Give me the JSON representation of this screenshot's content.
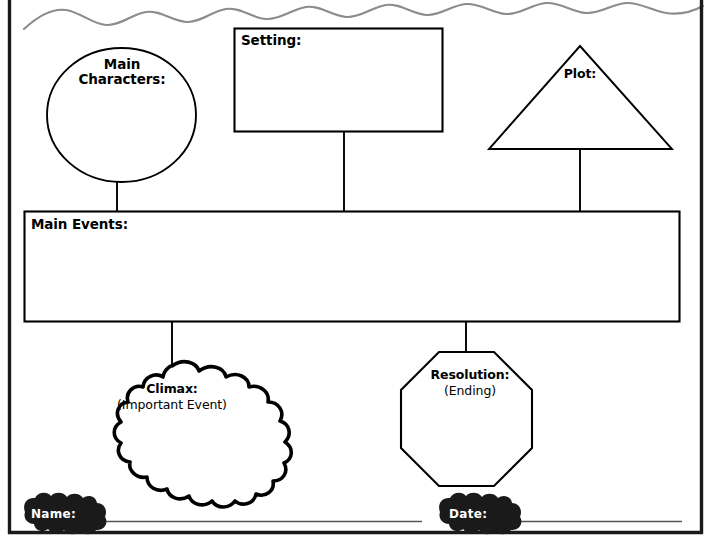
{
  "worksheet": {
    "type": "story-map-graphic-organizer",
    "page_width": 712,
    "page_height": 548,
    "border_color": "#1a1a1a",
    "wave_color": "#8c8c8c",
    "ink_color": "#000000",
    "paper_color": "#ffffff"
  },
  "nodes": {
    "main_characters": {
      "label": "Main",
      "label2": "Characters:",
      "shape": "ellipse"
    },
    "setting": {
      "label": "Setting:",
      "shape": "rectangle"
    },
    "plot": {
      "label": "Plot:",
      "shape": "triangle"
    },
    "main_events": {
      "label": "Main Events:",
      "shape": "rectangle"
    },
    "climax": {
      "label": "Climax:",
      "sublabel": "(Important Event)",
      "shape": "cloud"
    },
    "resolution": {
      "label": "Resolution:",
      "sublabel": "(Ending)",
      "shape": "octagon"
    }
  },
  "footer": {
    "name_label": "Name:",
    "date_label": "Date:"
  }
}
